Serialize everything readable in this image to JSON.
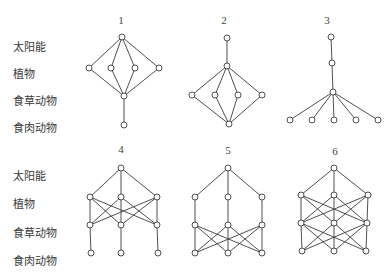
{
  "level_labels": [
    "太阳能",
    "植物",
    "食草动物",
    "食肉动物"
  ],
  "rows": [
    {
      "label_x": 13,
      "label_y": [
        46,
        73,
        100,
        127
      ]
    },
    {
      "label_x": 13,
      "label_y": [
        175,
        203,
        232,
        260
      ]
    }
  ],
  "diagrams": [
    {
      "id": "1",
      "header_x": 121,
      "header_y": 22,
      "nodes": {
        "sun": [
          [
            122,
            37
          ]
        ],
        "plant": [
          [
            89,
            68
          ],
          [
            111,
            68
          ],
          [
            135,
            68
          ],
          [
            159,
            68
          ]
        ],
        "herb": [
          [
            124,
            96
          ]
        ],
        "carn": [
          [
            124,
            125
          ]
        ]
      },
      "edges": "sun-plant:all; plant-herb:all; herb-carn:all"
    },
    {
      "id": "2",
      "header_x": 224,
      "header_y": 22,
      "nodes": {
        "sun": [
          [
            227,
            38
          ]
        ],
        "plant": [
          [
            227,
            66
          ]
        ],
        "herb": [
          [
            192,
            95
          ],
          [
            215,
            95
          ],
          [
            238,
            95
          ],
          [
            262,
            95
          ]
        ],
        "carn": [
          [
            229,
            124
          ]
        ]
      },
      "edges": "sun-plant:all; plant-herb:all; herb-carn:all"
    },
    {
      "id": "3",
      "header_x": 327,
      "header_y": 22,
      "nodes": {
        "sun": [
          [
            331,
            37
          ]
        ],
        "plant": [
          [
            332,
            63
          ]
        ],
        "herb": [
          [
            333,
            92
          ]
        ],
        "carn": [
          [
            290,
            120
          ],
          [
            312,
            120
          ],
          [
            334,
            120
          ],
          [
            356,
            120
          ],
          [
            378,
            120
          ]
        ]
      },
      "edges": "sun-plant:all; plant-herb:all; herb-carn:all"
    },
    {
      "id": "4",
      "header_x": 121,
      "header_y": 151,
      "nodes": {
        "sun": [
          [
            121,
            168
          ]
        ],
        "plant": [
          [
            90,
            197
          ],
          [
            121,
            197
          ],
          [
            157,
            197
          ]
        ],
        "herb": [
          [
            90,
            225
          ],
          [
            121,
            225
          ],
          [
            157,
            225
          ]
        ],
        "carn": [
          [
            91,
            253
          ],
          [
            121,
            253
          ],
          [
            158,
            253
          ]
        ]
      },
      "edges": "sun-plant:all; plant-herb:all; herb-carn:parallel"
    },
    {
      "id": "5",
      "header_x": 228,
      "header_y": 152,
      "nodes": {
        "sun": [
          [
            228,
            168
          ]
        ],
        "plant": [
          [
            195,
            197
          ],
          [
            228,
            197
          ],
          [
            262,
            197
          ]
        ],
        "herb": [
          [
            195,
            225
          ],
          [
            228,
            225
          ],
          [
            262,
            225
          ]
        ],
        "carn": [
          [
            195,
            253
          ],
          [
            228,
            253
          ],
          [
            262,
            253
          ]
        ]
      },
      "edges": "sun-plant:all; plant-herb:parallel; herb-carn:all"
    },
    {
      "id": "6",
      "header_x": 335,
      "header_y": 153,
      "nodes": {
        "sun": [
          [
            334,
            168
          ]
        ],
        "plant": [
          [
            301,
            195
          ],
          [
            334,
            195
          ],
          [
            368,
            195
          ]
        ],
        "herb": [
          [
            301,
            223
          ],
          [
            334,
            223
          ],
          [
            367,
            223
          ]
        ],
        "carn": [
          [
            302,
            251
          ],
          [
            334,
            251
          ],
          [
            366,
            251
          ]
        ]
      },
      "edges": "sun-plant:all; plant-herb:all; herb-carn:all"
    }
  ],
  "style": {
    "line_color": "#3c3c3c",
    "node_fill": "#ffffff",
    "node_stroke": "#3c3c3c",
    "node_radius": 3
  }
}
